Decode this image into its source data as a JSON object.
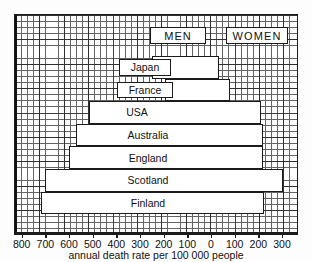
{
  "chart_data": {
    "type": "bar",
    "orientation": "horizontal-bidirectional",
    "title": "",
    "xlabel": "annual death rate per 100 000 people",
    "ylabel": "",
    "grid": true,
    "legend_position": "top",
    "groups": [
      "MEN",
      "WOMEN"
    ],
    "categories": [
      "Japan",
      "France",
      "USA",
      "Australia",
      "England",
      "Scotland",
      "Finland"
    ],
    "series": [
      {
        "name": "MEN",
        "side": "left",
        "values": [
          255,
          200,
          520,
          575,
          605,
          705,
          723
        ]
      },
      {
        "name": "WOMEN",
        "side": "right",
        "values": [
          30,
          75,
          205,
          215,
          215,
          300,
          220
        ]
      }
    ],
    "axis": {
      "left_max": 800,
      "right_max": 300,
      "zero": 0,
      "tick_values": [
        800,
        700,
        600,
        500,
        400,
        300,
        200,
        100,
        0,
        100,
        200,
        300
      ]
    }
  },
  "chart": {
    "group_labels": {
      "men": "MEN",
      "women": "WOMEN"
    },
    "axis_caption": "annual death rate per 100 000 people",
    "ticks": [
      {
        "label": "800"
      },
      {
        "label": "700"
      },
      {
        "label": "600"
      },
      {
        "label": "500"
      },
      {
        "label": "400"
      },
      {
        "label": "300"
      },
      {
        "label": "200"
      },
      {
        "label": "100"
      },
      {
        "label": "0"
      },
      {
        "label": "100"
      },
      {
        "label": "200"
      },
      {
        "label": "300"
      }
    ],
    "rows": [
      {
        "name": "Japan"
      },
      {
        "name": "France"
      },
      {
        "name": "USA"
      },
      {
        "name": "Australia"
      },
      {
        "name": "England"
      },
      {
        "name": "Scotland"
      },
      {
        "name": "Finland"
      }
    ],
    "colors": {
      "ink": "#1b1b1b",
      "bar_fill": "#ffffff",
      "hatch": "#4a4a4a",
      "background": "#ffffff"
    }
  }
}
